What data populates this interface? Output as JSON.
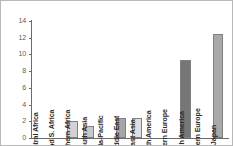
{
  "chart_data": {
    "type": "bar",
    "title": "",
    "subtitle": "",
    "xlabel": "",
    "ylabel": "",
    "ylim": [
      0,
      14
    ],
    "yticks": [
      0,
      2,
      4,
      6,
      8,
      10,
      12,
      14
    ],
    "ytick_labels": [
      "0",
      "2",
      "4",
      "6",
      "8",
      "10",
      "12",
      "14"
    ],
    "grid": false,
    "legend": false,
    "categories": [
      "Central Africa",
      "E. and S. Africa",
      "Northern Africa",
      "South Asia",
      "Asia-Pacific",
      "Middle East",
      "East Asia",
      "South America",
      "Eastern Europe",
      "North America",
      "Western Europe",
      "Japan"
    ],
    "values": [
      0,
      0,
      2.0,
      1.4,
      0,
      2.4,
      2.4,
      0,
      0,
      9.3,
      0,
      12.5
    ],
    "bar_colors": [
      "#ffffff",
      "#ffffff",
      "#d2d2d2",
      "#c9c9c9",
      "#ffffff",
      "#a6a6a6",
      "#e0e0e0",
      "#ffffff",
      "#ffffff",
      "#767676",
      "#ffffff",
      "#a9a9a9"
    ],
    "bar_edge_color": "#808080",
    "axis_color": "#6b6b6b",
    "label_color": "#2b2b2b",
    "tick_label_color": "#5a5a5a",
    "background_color": "#ffffff",
    "frame_color": "#b8b8b8"
  }
}
